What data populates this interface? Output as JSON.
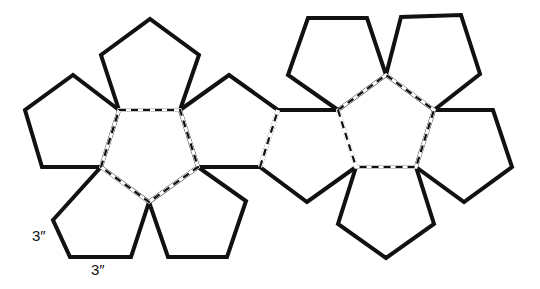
{
  "diagram": {
    "stroke_color": "#111111",
    "background": "#ffffff",
    "solid_pentagons": [
      {
        "name": "left-top-face",
        "points": "119,110 101,55 150,19 199,55 180,110"
      },
      {
        "name": "left-upper-left-face",
        "points": "119,110 73,75 25,110 42,167 101,167"
      },
      {
        "name": "left-upper-right-face",
        "points": "180,110 229,75 278,110 260,167 198,167"
      },
      {
        "name": "left-lower-left-face",
        "points": "101,167 149,202 131,257 70,257 53,220"
      },
      {
        "name": "left-lower-right-face",
        "points": "149,202 198,167 246,201 227,257 168,257"
      },
      {
        "name": "hinge-face",
        "points": "260,167 278,110 338,110 356,167 307,202"
      },
      {
        "name": "right-upper-left-face",
        "points": "338,110 288,75 308,18 367,18 386,75"
      },
      {
        "name": "right-upper-right-face",
        "points": "386,75 401,17 461,15 480,74 434,110"
      },
      {
        "name": "right-right-face",
        "points": "434,110 493,110 512,167 464,202 416,167"
      },
      {
        "name": "right-bottom-face",
        "points": "356,167 416,167 434,224 386,258 338,224"
      }
    ],
    "dashed_pentagons": [
      {
        "name": "left-center-face",
        "points": "119,110 180,110 198,167 149,202 101,167"
      },
      {
        "name": "right-center-face",
        "points": "338,110 386,75 434,110 416,167 356,167"
      }
    ],
    "dashed_edges": [
      {
        "name": "left-right-fold",
        "points": "260,167 278,110"
      },
      {
        "name": "hinge-fold",
        "points": "338,110 356,167"
      }
    ],
    "labels": [
      {
        "name": "side-length-label-vertical",
        "text": "3″",
        "x": 32,
        "y": 241
      },
      {
        "name": "side-length-label-horizontal",
        "text": "3″",
        "x": 91,
        "y": 275
      }
    ]
  }
}
